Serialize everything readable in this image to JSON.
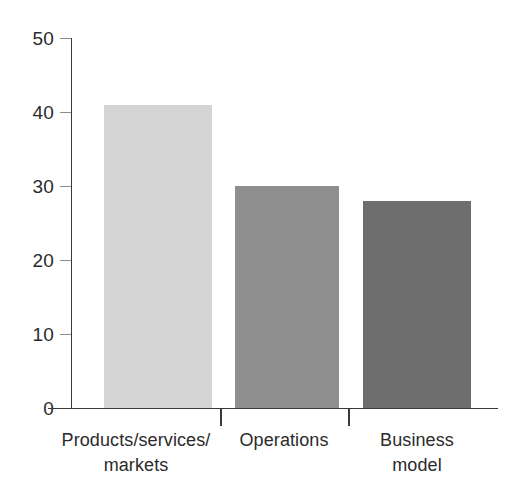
{
  "chart_data": {
    "type": "bar",
    "title": "",
    "subtitle": "",
    "xlabel": "",
    "ylabel": "",
    "categories": [
      "Products/services/\nmarkets",
      "Operations",
      "Business\nmodel"
    ],
    "values": [
      41,
      30,
      28
    ],
    "ylim": [
      0,
      50
    ],
    "yticks": [
      0,
      10,
      20,
      30,
      40,
      50
    ],
    "ytick_labels": [
      "0",
      "10",
      "20",
      "30",
      "40",
      "50"
    ],
    "grid": false,
    "legend": false,
    "legend_position": "none",
    "bar_colors": [
      "#d4d4d4",
      "#8e8e8e",
      "#6e6e6e"
    ],
    "axis_color": "#3a3a3a",
    "tick_color": "#8a8a8a",
    "text_color": "#2b2b2b",
    "background": "#ffffff"
  },
  "axis": {
    "y": {
      "ticks": [
        {
          "label": "50",
          "value": 50
        },
        {
          "label": "40",
          "value": 40
        },
        {
          "label": "30",
          "value": 30
        },
        {
          "label": "20",
          "value": 20
        },
        {
          "label": "10",
          "value": 10
        },
        {
          "label": "0",
          "value": 0
        }
      ]
    },
    "x": {
      "categories": [
        {
          "line1": "Products/services/",
          "line2": "markets"
        },
        {
          "line1": "Operations",
          "line2": ""
        },
        {
          "line1": "Business",
          "line2": "model"
        }
      ]
    }
  },
  "bars": [
    {
      "name": "products-services-markets",
      "value": 41,
      "color": "#d4d4d4"
    },
    {
      "name": "operations",
      "value": 30,
      "color": "#8e8e8e"
    },
    {
      "name": "business-model",
      "value": 28,
      "color": "#6e6e6e"
    }
  ]
}
